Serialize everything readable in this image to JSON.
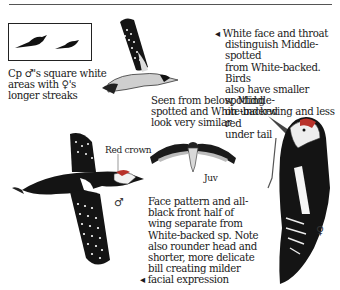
{
  "page": {
    "type": "field-guide illustration plate"
  },
  "inset": {
    "caption": "Cp ♂'s square white areas with ♀'s longer streaks"
  },
  "captions": {
    "top_right": "◂ White face and throat distinguish Middle-spotted from White-backed. Birds also have smaller spotting on underwing and less red under tail",
    "below_view": "Seen from below, Middle-spotted and White-backed look very similar",
    "face_pattern": "Face pattern and all-black front half of wing separate from White-backed sp. Note also rounder head and shorter, more delicate bill creating milder ◂ facial expression"
  },
  "lines": {
    "inset_caption": [
      "Cp ♂'s square white",
      "areas with ♀'s",
      "longer streaks"
    ],
    "top_right": [
      "◂ White face and throat",
      "distinguish Middle-spotted",
      "from White-backed. Birds",
      "also have smaller spotting",
      "on underwing and less red",
      "under tail"
    ],
    "below_view": [
      "Seen from below, Middle-",
      "spotted and White-backed",
      "look very similar"
    ],
    "face_pattern": [
      "Face pattern and all-",
      "black front half of",
      "wing separate from",
      "White-backed sp. Note",
      "also rounder head and",
      "shorter, more delicate",
      "bill creating milder",
      "◂ facial expression"
    ]
  },
  "labels": {
    "red_crown": "Red crown",
    "juv": "Juv",
    "male_symbol": "♂",
    "female_symbol": "♀"
  },
  "illustrations": [
    {
      "name": "inset-silhouettes",
      "description": "two perched bird silhouettes"
    },
    {
      "name": "flying-bird-top",
      "description": "woodpecker in flight, wings raised"
    },
    {
      "name": "flying-bird-below-juv",
      "description": "juvenile seen from below, wings spread"
    },
    {
      "name": "flying-bird-male",
      "description": "male in flight, spotted wings"
    },
    {
      "name": "perched-female",
      "description": "female clinging to trunk, profile"
    }
  ],
  "colors": {
    "ink": "#1a1a1a",
    "rule": "#555555",
    "crown_red": "#b8322a",
    "paper": "#ffffff"
  }
}
